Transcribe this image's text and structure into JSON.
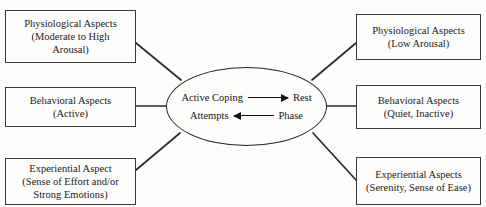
{
  "diagram": {
    "type": "hub-and-spoke",
    "hub": {
      "name": "active-coping-rest-phase",
      "row_top": {
        "left_term": "Active Coping",
        "arrow": "arrow-right-icon",
        "right_term": "Rest"
      },
      "row_bottom": {
        "left_term": "Attempts",
        "arrow": "arrow-left-icon",
        "right_term": "Phase"
      }
    },
    "left_nodes": [
      {
        "id": "phys-high",
        "lines": [
          "Physiological Aspects",
          "(Moderate to High",
          "Arousal)"
        ]
      },
      {
        "id": "behav-active",
        "lines": [
          "Behavioral Aspects",
          "(Active)"
        ]
      },
      {
        "id": "exp-effort",
        "lines": [
          "Experiential Aspect",
          "(Sense of Effort and/or",
          "Strong Emotions)"
        ]
      }
    ],
    "right_nodes": [
      {
        "id": "phys-low",
        "lines": [
          "Physiological Aspects",
          "(Low Arousal)"
        ]
      },
      {
        "id": "behav-quiet",
        "lines": [
          "Behavioral Aspects",
          "(Quiet, Inactive)"
        ]
      },
      {
        "id": "exp-serenity",
        "lines": [
          "Experiential Aspects",
          "(Serenity, Sense of Ease)"
        ]
      }
    ],
    "colors": {
      "background": "#fdfdfb",
      "stroke": "#3a3a38",
      "hub_stroke": "#262624",
      "text": "#1b1b1b"
    }
  }
}
